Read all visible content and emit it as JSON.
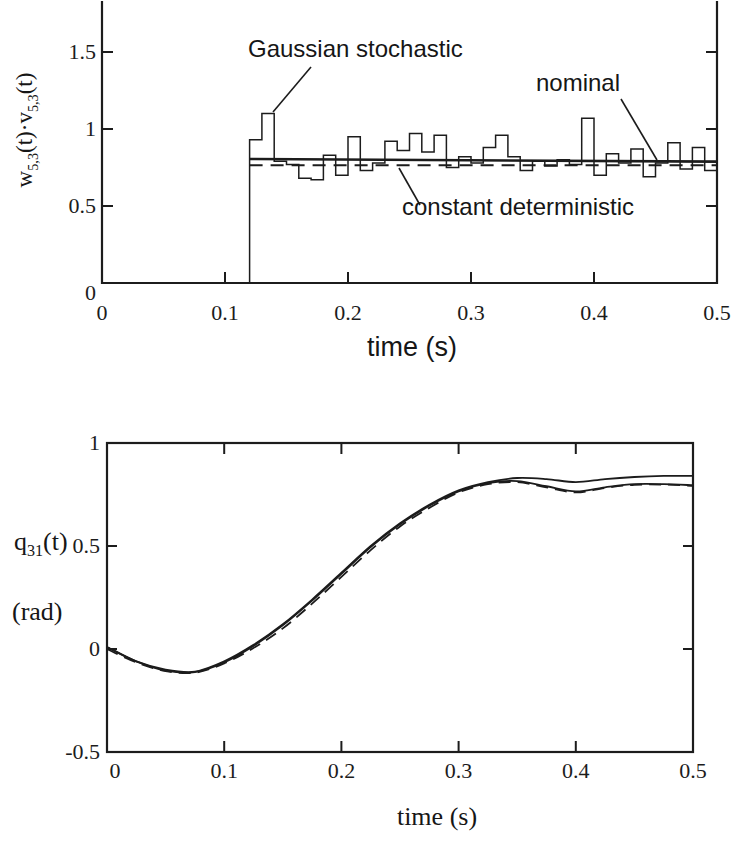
{
  "colors": {
    "ink": "#1c1c1c",
    "background": "#ffffff"
  },
  "chart_data": [
    {
      "type": "line",
      "title": "",
      "xlabel": "time (s)",
      "ylabel": "w5,3(t)·v5,3(t)",
      "ylabel_rich": {
        "pre": "w",
        "sub1": "5,3",
        "mid": "(t)·v",
        "sub2": "5,3",
        "post": "(t)"
      },
      "xlim": [
        0,
        0.5
      ],
      "ylim": [
        0,
        1.84
      ],
      "xtick_labels": [
        "0",
        "0.1",
        "0.2",
        "0.3",
        "0.4",
        "0.5"
      ],
      "xtick_values": [
        0,
        0.1,
        0.2,
        0.3,
        0.4,
        0.5
      ],
      "ytick_labels": [
        "0",
        "0.5",
        "1",
        "1.5"
      ],
      "ytick_values": [
        0,
        0.5,
        1,
        1.5
      ],
      "grid": false,
      "legend_position": "inline-annotations",
      "series": [
        {
          "name": "Gaussian stochastic",
          "style": "step",
          "t_start": 0.12,
          "dt": 0.01,
          "values": [
            0.93,
            1.1,
            0.79,
            0.77,
            0.68,
            0.67,
            0.83,
            0.7,
            0.95,
            0.73,
            0.78,
            0.92,
            0.86,
            0.97,
            0.85,
            0.96,
            0.75,
            0.82,
            0.78,
            0.88,
            0.96,
            0.82,
            0.73,
            0.79,
            0.76,
            0.8,
            0.77,
            1.07,
            0.7,
            0.84,
            0.78,
            0.87,
            0.69,
            0.78,
            0.91,
            0.74,
            0.88,
            0.73
          ]
        },
        {
          "name": "nominal",
          "style": "line",
          "x": [
            0.12,
            0.5
          ],
          "y": [
            0.805,
            0.788
          ]
        },
        {
          "name": "constant deterministic",
          "style": "dashed",
          "x": [
            0.12,
            0.5
          ],
          "y": [
            0.765,
            0.765
          ]
        }
      ],
      "annotations": [
        {
          "text": "Gaussian stochastic"
        },
        {
          "text": "nominal"
        },
        {
          "text": "constant deterministic"
        }
      ]
    },
    {
      "type": "line",
      "title": "",
      "xlabel": "time (s)",
      "ylabel": "q31(t) (rad)",
      "ylabel_rich": {
        "pre": "q",
        "sub": "31",
        "post": "(t)",
        "unit": "(rad)"
      },
      "xlim": [
        0,
        0.5
      ],
      "ylim": [
        -0.5,
        1
      ],
      "xtick_labels": [
        "0",
        "0.1",
        "0.2",
        "0.3",
        "0.4",
        "0.5"
      ],
      "xtick_values": [
        0,
        0.1,
        0.2,
        0.3,
        0.4,
        0.5
      ],
      "ytick_labels": [
        "-0.5",
        "0",
        "0.5",
        "1"
      ],
      "ytick_values": [
        -0.5,
        0,
        0.5,
        1
      ],
      "grid": false,
      "x": [
        0,
        0.025,
        0.05,
        0.075,
        0.1,
        0.125,
        0.15,
        0.175,
        0.2,
        0.225,
        0.25,
        0.275,
        0.3,
        0.325,
        0.35,
        0.375,
        0.4,
        0.425,
        0.45,
        0.475,
        0.5
      ],
      "series": [
        {
          "name": "nominal",
          "style": "line",
          "y": [
            0.01,
            -0.06,
            -0.1,
            -0.11,
            -0.06,
            0.02,
            0.12,
            0.24,
            0.37,
            0.5,
            0.61,
            0.7,
            0.77,
            0.81,
            0.83,
            0.825,
            0.81,
            0.825,
            0.835,
            0.84,
            0.84
          ]
        },
        {
          "name": "Gaussian stochastic",
          "style": "line",
          "y": [
            0.01,
            -0.06,
            -0.105,
            -0.112,
            -0.065,
            0.015,
            0.115,
            0.235,
            0.365,
            0.495,
            0.605,
            0.695,
            0.765,
            0.805,
            0.815,
            0.79,
            0.765,
            0.785,
            0.8,
            0.8,
            0.795
          ]
        },
        {
          "name": "constant deterministic",
          "style": "dashed",
          "y": [
            0.0,
            -0.065,
            -0.107,
            -0.115,
            -0.07,
            0.005,
            0.1,
            0.22,
            0.35,
            0.48,
            0.595,
            0.685,
            0.76,
            0.8,
            0.81,
            0.785,
            0.76,
            0.782,
            0.797,
            0.798,
            0.792
          ]
        }
      ]
    }
  ]
}
